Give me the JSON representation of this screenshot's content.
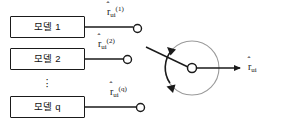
{
  "figure": {
    "background_color": "#ffffff",
    "stroke_color": "#1a1a1a",
    "light_stroke_color": "#9a9a9a",
    "width": 281,
    "height": 137
  },
  "models": [
    {
      "label": "모델 1",
      "output_base": "r",
      "output_sub": "ui",
      "output_sup": "(1)"
    },
    {
      "label": "모델 2",
      "output_base": "r",
      "output_sub": "ui",
      "output_sup": "(2)"
    },
    {
      "label": "모델 q",
      "output_base": "r",
      "output_sub": "ui",
      "output_sup": "(q)"
    }
  ],
  "ellipsis": "⋮",
  "dot": "·",
  "hat": "ˆ",
  "aggregator": {
    "name": "combination-circle",
    "center_node": "sum-node"
  },
  "output": {
    "base": "r",
    "sub": "ui"
  },
  "caption": {
    "text": ""
  }
}
